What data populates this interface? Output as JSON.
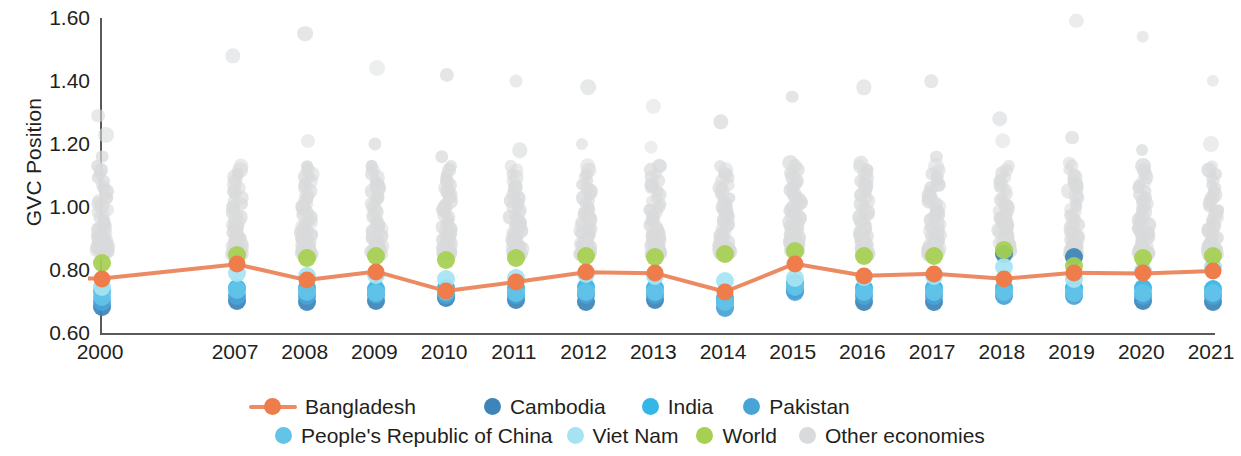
{
  "chart_data": {
    "type": "scatter",
    "title": "",
    "xlabel": "",
    "ylabel": "GVC Position",
    "ylim": [
      0.6,
      1.6
    ],
    "yticks": [
      "0.60",
      "0.80",
      "1.00",
      "1.20",
      "1.40",
      "1.60"
    ],
    "ytick_values": [
      0.6,
      0.8,
      1.0,
      1.2,
      1.4,
      1.6
    ],
    "grid": false,
    "legend_position": "bottom",
    "categories": [
      "2000",
      "2007",
      "2008",
      "2009",
      "2010",
      "2011",
      "2012",
      "2013",
      "2014",
      "2015",
      "2016",
      "2017",
      "2018",
      "2019",
      "2020",
      "2021"
    ],
    "colors": {
      "bangladesh_line": "#ec8b63",
      "bangladesh_marker": "#ef7d4b",
      "cambodia": "#3d85b8",
      "india": "#35b6e8",
      "pakistan": "#4aa3d6",
      "prc": "#62c4e8",
      "viet_nam": "#a6e3f2",
      "world": "#a5d051",
      "other_economies": "#d9dadb",
      "axis": "#58595b",
      "text": "#231f20"
    },
    "series": [
      {
        "name": "Bangladesh",
        "key": "bangladesh",
        "type": "line",
        "values": [
          0.773,
          0.818,
          0.768,
          0.795,
          0.733,
          0.762,
          0.793,
          0.79,
          0.731,
          0.82,
          0.782,
          0.788,
          0.772,
          0.791,
          0.789,
          0.797
        ]
      },
      {
        "name": "Cambodia",
        "key": "cambodia",
        "type": "scatter",
        "values": [
          0.683,
          0.702,
          0.7,
          0.702,
          0.712,
          0.706,
          0.7,
          0.706,
          0.7,
          0.738,
          0.7,
          0.7,
          0.85,
          0.841,
          0.702,
          0.7
        ]
      },
      {
        "name": "India",
        "key": "india",
        "type": "scatter",
        "values": [
          0.733,
          0.744,
          0.744,
          0.74,
          0.742,
          0.742,
          0.745,
          0.743,
          0.71,
          0.758,
          0.744,
          0.742,
          0.744,
          0.742,
          0.742,
          0.74
        ]
      },
      {
        "name": "Pakistan",
        "key": "pakistan",
        "type": "scatter",
        "values": [
          0.7,
          0.718,
          0.716,
          0.72,
          0.722,
          0.72,
          0.722,
          0.722,
          0.68,
          0.73,
          0.718,
          0.718,
          0.718,
          0.718,
          0.716,
          0.716
        ]
      },
      {
        "name": "People's Republic of China",
        "key": "prc",
        "type": "scatter",
        "values": [
          0.715,
          0.735,
          0.73,
          0.728,
          0.73,
          0.728,
          0.73,
          0.73,
          0.7,
          0.745,
          0.73,
          0.73,
          0.73,
          0.728,
          0.728,
          0.728
        ]
      },
      {
        "name": "Viet Nam",
        "key": "viet_nam",
        "type": "scatter",
        "values": [
          0.746,
          0.79,
          0.782,
          0.783,
          0.773,
          0.776,
          0.786,
          0.781,
          0.765,
          0.776,
          0.778,
          0.78,
          0.81,
          0.772,
          0.796,
          0.808
        ]
      },
      {
        "name": "World",
        "key": "world",
        "type": "scatter",
        "values": [
          0.822,
          0.848,
          0.838,
          0.843,
          0.832,
          0.838,
          0.845,
          0.84,
          0.85,
          0.86,
          0.843,
          0.843,
          0.862,
          0.812,
          0.838,
          0.843
        ]
      }
    ],
    "other_economies": {
      "name": "Other economies",
      "note": "Dense grey point cloud, one column per year",
      "columns": [
        {
          "year": "2000",
          "min": 0.86,
          "max": 1.29,
          "count": 46,
          "outliers": [
            1.29,
            1.23,
            1.16
          ]
        },
        {
          "year": "2007",
          "min": 0.85,
          "max": 1.48,
          "count": 48,
          "outliers": [
            1.48,
            1.12
          ]
        },
        {
          "year": "2008",
          "min": 0.85,
          "max": 1.55,
          "count": 48,
          "outliers": [
            1.55,
            1.21,
            1.12
          ]
        },
        {
          "year": "2009",
          "min": 0.85,
          "max": 1.44,
          "count": 48,
          "outliers": [
            1.44,
            1.2,
            1.1
          ]
        },
        {
          "year": "2010",
          "min": 0.85,
          "max": 1.42,
          "count": 48,
          "outliers": [
            1.42,
            1.16,
            1.07
          ]
        },
        {
          "year": "2011",
          "min": 0.85,
          "max": 1.4,
          "count": 48,
          "outliers": [
            1.4,
            1.18,
            1.12
          ]
        },
        {
          "year": "2012",
          "min": 0.85,
          "max": 1.38,
          "count": 48,
          "outliers": [
            1.38,
            1.2,
            1.13
          ]
        },
        {
          "year": "2013",
          "min": 0.85,
          "max": 1.32,
          "count": 48,
          "outliers": [
            1.32,
            1.19,
            1.1
          ]
        },
        {
          "year": "2014",
          "min": 0.85,
          "max": 1.27,
          "count": 48,
          "outliers": [
            1.27,
            1.12
          ]
        },
        {
          "year": "2015",
          "min": 0.86,
          "max": 1.35,
          "count": 48,
          "outliers": [
            1.35,
            1.14
          ]
        },
        {
          "year": "2016",
          "min": 0.85,
          "max": 1.38,
          "count": 48,
          "outliers": [
            1.38,
            1.14
          ]
        },
        {
          "year": "2017",
          "min": 0.85,
          "max": 1.4,
          "count": 48,
          "outliers": [
            1.4,
            1.16
          ]
        },
        {
          "year": "2018",
          "min": 0.86,
          "max": 1.28,
          "count": 48,
          "outliers": [
            1.28,
            1.21,
            1.12
          ]
        },
        {
          "year": "2019",
          "min": 0.85,
          "max": 1.59,
          "count": 48,
          "outliers": [
            1.59,
            1.22,
            1.14
          ]
        },
        {
          "year": "2020",
          "min": 0.85,
          "max": 1.54,
          "count": 48,
          "outliers": [
            1.54,
            1.18,
            1.1
          ]
        },
        {
          "year": "2021",
          "min": 0.85,
          "max": 1.4,
          "count": 48,
          "outliers": [
            1.4,
            1.2,
            1.12
          ]
        }
      ]
    }
  },
  "axis": {
    "ylabel": "GVC Position"
  },
  "legend": {
    "row1": [
      {
        "label": "Bangladesh",
        "marker": "line",
        "color": "#ef7d4b"
      },
      {
        "label": "Cambodia",
        "marker": "dot",
        "color": "#3d85b8"
      },
      {
        "label": "India",
        "marker": "dot",
        "color": "#35b6e8"
      },
      {
        "label": "Pakistan",
        "marker": "dot",
        "color": "#4aa3d6"
      }
    ],
    "row2": [
      {
        "label": "People's Republic of China",
        "marker": "dot",
        "color": "#62c4e8"
      },
      {
        "label": "Viet Nam",
        "marker": "dot",
        "color": "#a6e3f2"
      },
      {
        "label": "World",
        "marker": "dot",
        "color": "#a5d051"
      },
      {
        "label": "Other economies",
        "marker": "dot",
        "color": "#d9dadb"
      }
    ]
  }
}
